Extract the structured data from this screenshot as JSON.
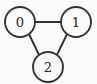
{
  "figure": {
    "name": "undirected-graph-triangle",
    "width": 97,
    "height": 84,
    "background_color": "#fbfbfb",
    "stroke_color": "#333333",
    "label_color": "#222222",
    "node_fill_color": "#fbfbfb"
  },
  "graph": {
    "type": "undirected",
    "node_radius": 15,
    "nodes": [
      {
        "id": "0",
        "label": "0",
        "cx": 20,
        "cy": 22
      },
      {
        "id": "1",
        "label": "1",
        "cx": 76,
        "cy": 22
      },
      {
        "id": "2",
        "label": "2",
        "cx": 48,
        "cy": 67
      }
    ],
    "edges": [
      {
        "id": "edge-0-1",
        "source": "0",
        "target": "1",
        "x1": 35,
        "y1": 22,
        "x2": 61,
        "y2": 22
      },
      {
        "id": "edge-0-2",
        "source": "0",
        "target": "2",
        "x1": 28.9,
        "y1": 34.0,
        "x2": 39.1,
        "y2": 55.0
      },
      {
        "id": "edge-1-2",
        "source": "1",
        "target": "2",
        "x1": 67.1,
        "y1": 34.0,
        "x2": 56.9,
        "y2": 55.0
      }
    ]
  }
}
